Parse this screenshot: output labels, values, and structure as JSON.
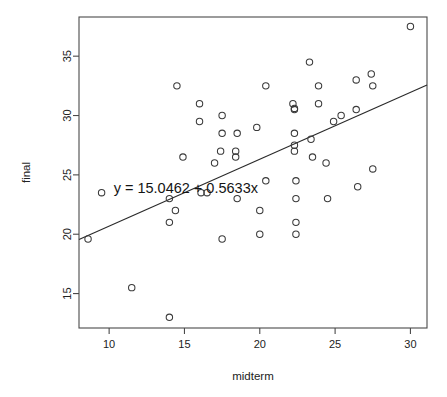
{
  "chart_data": {
    "type": "scatter",
    "title": "",
    "xlabel": "midterm",
    "ylabel": "final",
    "xlim": [
      8.0,
      31.1
    ],
    "ylim": [
      12.1,
      38.3
    ],
    "xticks": [
      10,
      15,
      20,
      25,
      30
    ],
    "yticks": [
      15,
      20,
      25,
      30,
      35
    ],
    "xtick_labels": [
      "10",
      "15",
      "20",
      "25",
      "30"
    ],
    "ytick_labels": [
      "15",
      "20",
      "25",
      "30",
      "35"
    ],
    "grid": false,
    "legend": "none",
    "marker": "open-circle",
    "annotations": [
      {
        "name": "regression-equation",
        "text": "y = 15.0462 + 0.5633x",
        "x": 10.3,
        "y": 23.9
      }
    ],
    "series": [
      {
        "name": "students",
        "points": [
          [
            8.6,
            19.6
          ],
          [
            9.5,
            23.5
          ],
          [
            11.5,
            15.5
          ],
          [
            14.0,
            13.0
          ],
          [
            14.0,
            23.0
          ],
          [
            14.0,
            21.0
          ],
          [
            14.4,
            22.0
          ],
          [
            14.5,
            32.5
          ],
          [
            14.9,
            26.5
          ],
          [
            16.0,
            31.0
          ],
          [
            16.0,
            29.5
          ],
          [
            16.1,
            23.5
          ],
          [
            16.5,
            23.5
          ],
          [
            17.0,
            26.0
          ],
          [
            17.4,
            27.0
          ],
          [
            17.5,
            28.5
          ],
          [
            17.5,
            30.0
          ],
          [
            17.5,
            19.6
          ],
          [
            18.4,
            26.5
          ],
          [
            18.4,
            27.0
          ],
          [
            18.5,
            28.5
          ],
          [
            18.5,
            23.0
          ],
          [
            19.8,
            29.0
          ],
          [
            20.0,
            20.0
          ],
          [
            20.0,
            22.0
          ],
          [
            20.4,
            32.5
          ],
          [
            20.4,
            24.5
          ],
          [
            22.2,
            31.0
          ],
          [
            22.3,
            30.5
          ],
          [
            22.3,
            30.6
          ],
          [
            22.3,
            28.5
          ],
          [
            22.3,
            27.5
          ],
          [
            22.3,
            27.0
          ],
          [
            22.4,
            24.5
          ],
          [
            22.4,
            23.0
          ],
          [
            22.4,
            21.0
          ],
          [
            22.4,
            20.0
          ],
          [
            23.3,
            34.5
          ],
          [
            23.4,
            28.0
          ],
          [
            23.5,
            26.5
          ],
          [
            23.9,
            32.5
          ],
          [
            23.9,
            31.0
          ],
          [
            24.4,
            26.0
          ],
          [
            24.5,
            23.0
          ],
          [
            24.9,
            29.5
          ],
          [
            25.4,
            30.0
          ],
          [
            26.4,
            33.0
          ],
          [
            26.4,
            30.5
          ],
          [
            26.5,
            24.0
          ],
          [
            27.4,
            33.5
          ],
          [
            27.5,
            32.5
          ],
          [
            27.5,
            25.5
          ],
          [
            30.0,
            37.5
          ]
        ]
      }
    ],
    "fit": {
      "name": "least-squares-line",
      "type": "line",
      "intercept": 15.0462,
      "slope": 0.5633,
      "equation": "y = 15.0462 + 0.5633x"
    }
  }
}
